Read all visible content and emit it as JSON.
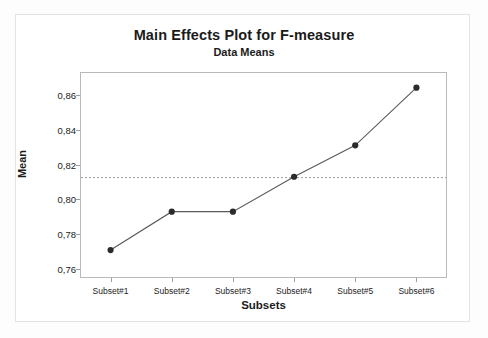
{
  "chart_data": {
    "type": "line",
    "title": "Main Effects Plot for F-measure",
    "subtitle": "Data Means",
    "xlabel": "Subsets",
    "ylabel": "Mean",
    "categories": [
      "Subset#1",
      "Subset#2",
      "Subset#3",
      "Subset#4",
      "Subset#5",
      "Subset#6"
    ],
    "values": [
      0.771,
      0.793,
      0.793,
      0.813,
      0.831,
      0.864
    ],
    "series": [
      {
        "name": "Mean",
        "values": [
          0.771,
          0.793,
          0.793,
          0.813,
          0.831,
          0.864
        ]
      }
    ],
    "ylim": [
      0.755,
      0.873
    ],
    "yticks": [
      0.76,
      0.78,
      0.8,
      0.82,
      0.84,
      0.86
    ],
    "ytick_labels": [
      "0,76",
      "0,78",
      "0,80",
      "0,82",
      "0,84",
      "0,86"
    ],
    "reference_line": {
      "value": 0.8125,
      "style": "dashed",
      "label": ""
    },
    "grid": false,
    "legend": false,
    "decimal_separator": ",",
    "colors": {
      "line": "#5a5a5a",
      "marker": "#2b2b2b",
      "reference_line": "#9a9a9a",
      "axis": "#b9b9b9",
      "text": "#1b1b1b",
      "background": "#ffffff"
    }
  }
}
